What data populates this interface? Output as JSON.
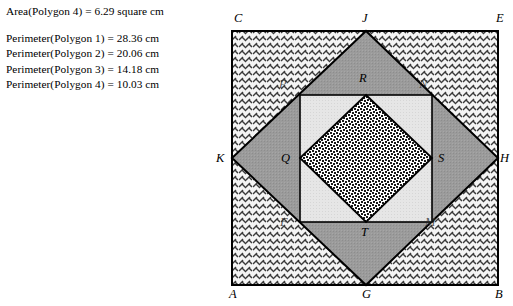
{
  "measurements": {
    "area_line": "Area(Polygon 4) = 6.29 square cm",
    "perimeter_lines": [
      "Perimeter(Polygon 1) = 28.36 cm",
      "Perimeter(Polygon 2) = 20.06 cm",
      "Perimeter(Polygon 3) = 14.18 cm",
      "Perimeter(Polygon 4) = 10.03 cm"
    ]
  },
  "figure": {
    "vertex_labels": [
      {
        "name": "C",
        "text": "C",
        "x": 234,
        "y": 12,
        "faint": false
      },
      {
        "name": "J",
        "text": "J",
        "x": 362,
        "y": 12,
        "faint": false
      },
      {
        "name": "E",
        "text": "E",
        "x": 496,
        "y": 12,
        "faint": false
      },
      {
        "name": "P",
        "text": "P",
        "x": 279,
        "y": 78,
        "faint": true
      },
      {
        "name": "R",
        "text": "R",
        "x": 359,
        "y": 72,
        "faint": false
      },
      {
        "name": "N",
        "text": "N",
        "x": 419,
        "y": 78,
        "faint": true
      },
      {
        "name": "K",
        "text": "K",
        "x": 216,
        "y": 152,
        "faint": false
      },
      {
        "name": "Q",
        "text": "Q",
        "x": 281,
        "y": 152,
        "faint": false
      },
      {
        "name": "S",
        "text": "S",
        "x": 438,
        "y": 152,
        "faint": false
      },
      {
        "name": "H",
        "text": "H",
        "x": 500,
        "y": 152,
        "faint": false
      },
      {
        "name": "F",
        "text": "F",
        "x": 280,
        "y": 216,
        "faint": true
      },
      {
        "name": "T",
        "text": "T",
        "x": 361,
        "y": 226,
        "faint": false
      },
      {
        "name": "M",
        "text": "M",
        "x": 425,
        "y": 216,
        "faint": true
      },
      {
        "name": "A",
        "text": "A",
        "x": 229,
        "y": 288,
        "faint": false
      },
      {
        "name": "G",
        "text": "G",
        "x": 362,
        "y": 288,
        "faint": false
      },
      {
        "name": "B",
        "text": "B",
        "x": 495,
        "y": 288,
        "faint": false
      }
    ],
    "colors": {
      "outline": "#000000",
      "outer_square_fill": "#f2f2f2",
      "diamond_fill": "#9a9a9a",
      "inner_square_fill": "#e2e2e2",
      "inner_diamond_fill": "#ffffff"
    },
    "geometry": {
      "outer_square": {
        "left": 232,
        "top": 31,
        "right": 498,
        "bottom": 285
      },
      "diamond_points": "366,31 498,158 366,285 232,158",
      "inner_square": {
        "left": 300,
        "top": 95,
        "right": 432,
        "bottom": 222
      },
      "inner_diamond_points": "366,95 432,158 366,222 300,158"
    }
  }
}
